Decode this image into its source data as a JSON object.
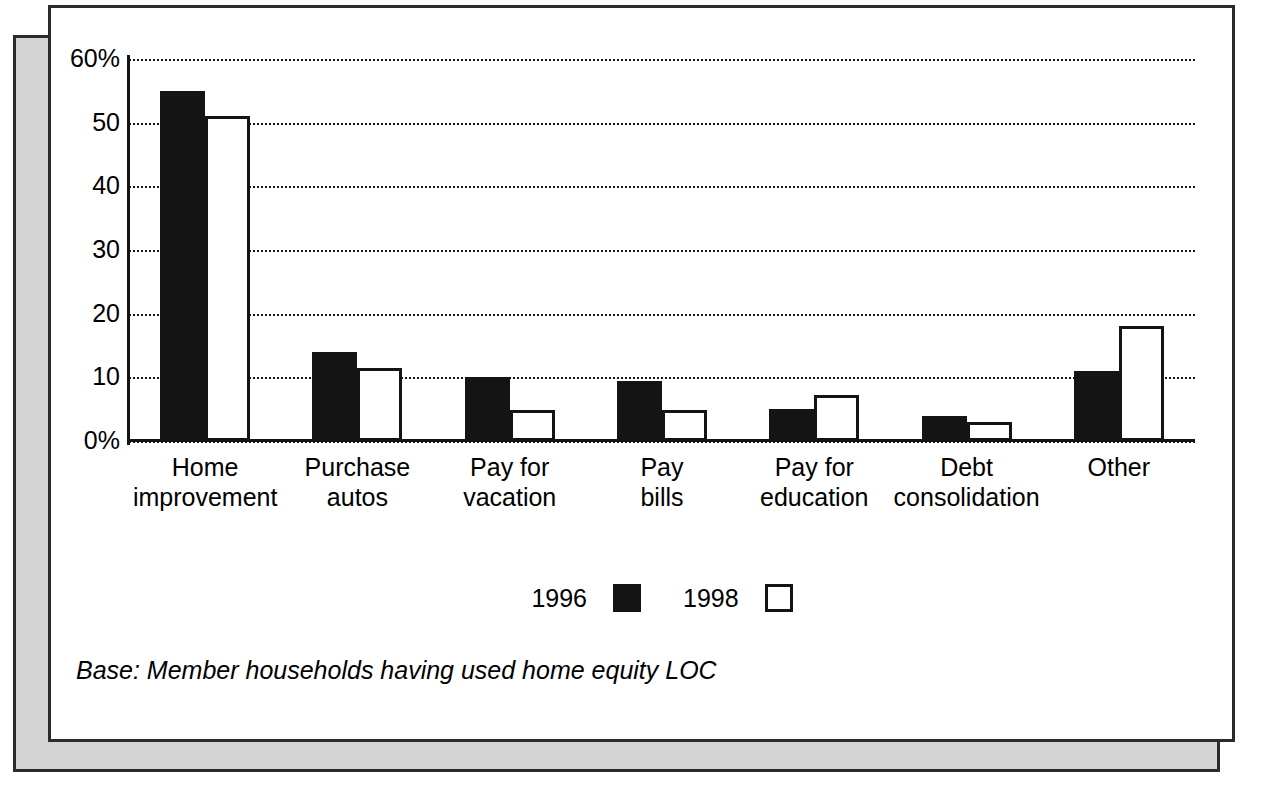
{
  "chart_data": {
    "type": "bar",
    "title": "",
    "xlabel": "",
    "ylabel": "",
    "ylim": [
      0,
      60
    ],
    "yticks": [
      0,
      10,
      20,
      30,
      40,
      50,
      60
    ],
    "ytick_labels": [
      "0%",
      "10",
      "20",
      "30",
      "40",
      "50",
      "60%"
    ],
    "grid": true,
    "legend_position": "bottom-center",
    "categories": [
      "Home improvement",
      "Purchase autos",
      "Pay for vacation",
      "Pay bills",
      "Pay for education",
      "Debt consolidation",
      "Other"
    ],
    "category_lines": [
      [
        "Home",
        "improvement"
      ],
      [
        "Purchase",
        "autos"
      ],
      [
        "Pay for",
        "vacation"
      ],
      [
        "Pay",
        "bills"
      ],
      [
        "Pay for",
        "education"
      ],
      [
        "Debt",
        "consolidation"
      ],
      [
        "Other"
      ]
    ],
    "series": [
      {
        "name": "1996",
        "style": "filled",
        "color": "#141414",
        "values": [
          55,
          14,
          10,
          9.5,
          5,
          4,
          11
        ]
      },
      {
        "name": "1998",
        "style": "hollow",
        "color": "#ffffff",
        "values": [
          51,
          11.5,
          4.8,
          4.8,
          7.3,
          3,
          18
        ]
      }
    ],
    "annotations": [
      "Base: Member households having used home equity LOC"
    ]
  },
  "legend": {
    "items": [
      {
        "label": "1996",
        "swatch": "filled-square"
      },
      {
        "label": "1998",
        "swatch": "hollow-square"
      }
    ]
  },
  "note": {
    "text": "Base: Member households having used home equity LOC"
  },
  "colors": {
    "series_1996": "#141414",
    "series_1998": "#ffffff",
    "axis": "#141414",
    "grid": "#141414",
    "paper": "#ffffff",
    "shadow_panel": "#d4d4d4",
    "frame_border": "#2b2b2b"
  }
}
